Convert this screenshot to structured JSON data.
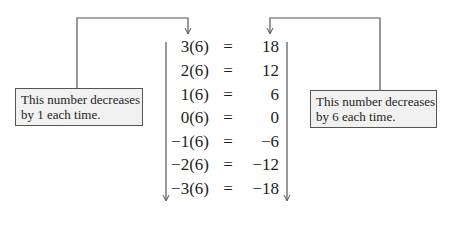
{
  "notes": {
    "left": {
      "line1": "This number decreases",
      "line2": "by 1 each time."
    },
    "right": {
      "line1": "This number decreases",
      "line2": "by 6 each time."
    }
  },
  "equations": [
    {
      "lhs": "3(6)",
      "sign": "=",
      "rhs": "18"
    },
    {
      "lhs": "2(6)",
      "sign": "=",
      "rhs": "12"
    },
    {
      "lhs": "1(6)",
      "sign": "=",
      "rhs": "6"
    },
    {
      "lhs": "0(6)",
      "sign": "=",
      "rhs": "0"
    },
    {
      "lhs": "−1(6)",
      "sign": "=",
      "rhs": "−6"
    },
    {
      "lhs": "−2(6)",
      "sign": "=",
      "rhs": "−12"
    },
    {
      "lhs": "−3(6)",
      "sign": "=",
      "rhs": "−18"
    }
  ],
  "colors": {
    "line": "#555555",
    "box_fill": "#f1f1f1",
    "text": "#231f20"
  }
}
